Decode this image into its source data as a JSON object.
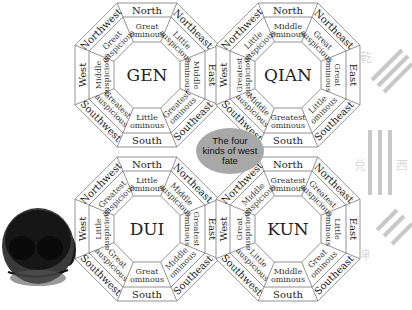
{
  "title_bubble": [
    "The four",
    "kinds of west",
    "fate"
  ],
  "directions": [
    "North",
    "Northeast",
    "East",
    "Southeast",
    "South",
    "Southwest",
    "West",
    "Northwest"
  ],
  "charts": [
    {
      "name": "GEN",
      "fates": {
        "North": [
          "Great",
          "ominous"
        ],
        "Northeast": [
          "Little",
          "auspicious"
        ],
        "East": [
          "Middle",
          "ominous"
        ],
        "Southeast": [
          "Greatest",
          "ominous"
        ],
        "South": [
          "Little",
          "ominous"
        ],
        "Southwest": [
          "Greatest",
          "auspicious"
        ],
        "West": [
          "Middle",
          "auspicious"
        ],
        "Northwest": [
          "Great",
          "auspicious"
        ]
      }
    },
    {
      "name": "QIAN",
      "fates": {
        "North": [
          "Middle",
          "ominous"
        ],
        "Northeast": [
          "Great",
          "auspicious"
        ],
        "East": [
          "Great",
          "ominous"
        ],
        "Southeast": [
          "Little",
          "ominous"
        ],
        "South": [
          "Greatest",
          "ominous"
        ],
        "Southwest": [
          "Middle",
          "auspicious"
        ],
        "West": [
          "Greatest",
          "auspicious"
        ],
        "Northwest": [
          "Little",
          "auspicious"
        ]
      }
    },
    {
      "name": "DUI",
      "fates": {
        "North": [
          "Little",
          "ominous"
        ],
        "Northeast": [
          "Middle",
          "auspicious"
        ],
        "East": [
          "Greatest",
          "ominous"
        ],
        "Southeast": [
          "Middle",
          "ominous"
        ],
        "South": [
          "Great",
          "ominous"
        ],
        "Southwest": [
          "Great",
          "auspicious"
        ],
        "West": [
          "Little",
          "auspicious"
        ],
        "Northwest": [
          "Greatest",
          "auspicious"
        ]
      }
    },
    {
      "name": "KUN",
      "fates": {
        "North": [
          "Greatest",
          "ominous"
        ],
        "Northeast": [
          "Greatest",
          "auspicious"
        ],
        "East": [
          "Little",
          "ominous"
        ],
        "Southeast": [
          "Great",
          "ominous"
        ],
        "South": [
          "Middle",
          "ominous"
        ],
        "Southwest": [
          "Little",
          "auspicious"
        ],
        "West": [
          "Great",
          "auspicious"
        ],
        "Northwest": [
          "Middle",
          "auspicious"
        ]
      }
    }
  ],
  "side_glyphs": [
    "乾",
    "兑",
    "西",
    "坤"
  ],
  "left_image": "mascot-head"
}
